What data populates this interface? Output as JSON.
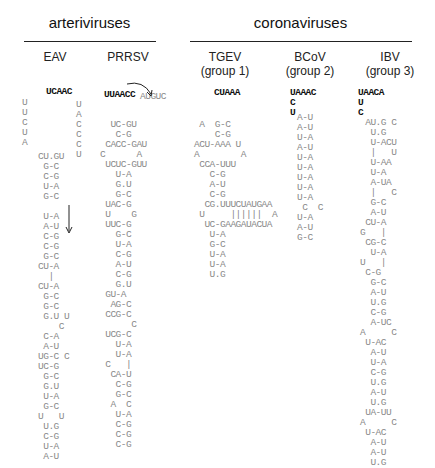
{
  "groups": {
    "arteriviruses": "arteriviruses",
    "coronaviruses": "coronaviruses"
  },
  "viruses": {
    "eav": {
      "name": "EAV",
      "subtitle": ""
    },
    "prrsv": {
      "name": "PRRSV",
      "subtitle": ""
    },
    "tgev": {
      "name": "TGEV",
      "subtitle": "(group 1)"
    },
    "bcov": {
      "name": "BCoV",
      "subtitle": "(group 2)"
    },
    "ibv": {
      "name": "IBV",
      "subtitle": "(group 3)"
    }
  },
  "structures": {
    "eav": {
      "loop_bold": "UCAAC",
      "loop_left": "U\nU\nC\nU\nA",
      "loop_right": "U\nA\nC\nC\nC\nU",
      "stem": "CU.GU\n G-C\n C-G\n U-A\n G-C\n  \n U-A\n A-U\n C-G\n C-G\n G-C\nCU-A\n  |\nCU-A\n G-C\n G-C\n G.U U\n    C\n C-A\n A-U\nUG-C C\nUC-G\n G-C\n G.U\n U-A\n G-C\nU   U\n U.G\n C-G\n U-A\n A-U"
    },
    "prrsv": {
      "loop_bold": "UUAACC",
      "loop_right": "AUGUC",
      "stem": "  UC-GU\n   C-G\n CACC-GAU\nC      A\n UCUC-GUU\n   U-A\n   G.U\n   G-C\n UAC-G\n U    G\n UUC-G\n   G-C\n   U-A\n   C-G\n   A-U\n   C-G\n   G.U\n GU-A\n  AG-C\n CCG-C\n      C\n UCG-C\n   U-A\n   U-A\n C   |\n  CA-U\n   C-G\n   G-C\n  A  C\n   U-A\n   C-G\n   C-G\n   C-G"
    },
    "tgev": {
      "loop_bold": "CUAAA",
      "stem": " A  G-C\n    C-G\nACU-AAA U\nA        A\n CCA-UUU\n   C-G\n   A-U\n   C-G\n  CG.UUUCUAUGAA\n U     ||||||  A\n  UC-GAAGAUACUA\n   U-A\n   G-C\n   U-A\n   U-A\n   U.G"
    },
    "bcov": {
      "loop_bold": "UAAAC\nC\nU",
      "stem": "A-U\nA-U\nU-A\nA-U\nU-A\nU-A\nU-A\nU-A\nU-A\n C  C\nU-A\nA-U\nG-C"
    },
    "ibv": {
      "loop_bold": "UAACA\nU\nC",
      "stem": " AU.G C\n  U.G\n  U-ACU\n  |   U\n  U-AA\n  U-A\n  A-UA\n  |   C\n  G-C\n  A-U\n CU-A\nG   |\n CG-C\n  U-A\nU   |\n C-G\n  G-C\n  A-U\n  U.G\n  C-G\n  A-UC\nA     C\n U-AC\n  A-U\n  U-A\n  C-G\n  U.G\n  A-U\n  U.G\n UA-UU\nA     C\n U-AC\n  A-U\n  A-U\n  U.G"
    }
  }
}
